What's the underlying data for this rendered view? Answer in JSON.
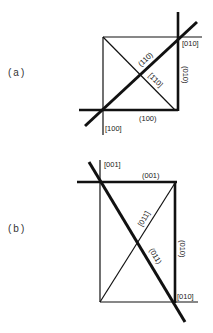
{
  "figure": {
    "panels": [
      {
        "id": "a",
        "label": "(a)",
        "annotations": {
          "top_right_direction": "[010]",
          "right_plane": "(010)",
          "diagonal_plane": "(110)",
          "anti_diagonal_direction": "[1̄10]",
          "bottom_plane": "(100)",
          "bottom_left_direction": "[100]"
        }
      },
      {
        "id": "b",
        "label": "(b)",
        "annotations": {
          "top_left_direction": "[001]",
          "top_plane": "(001)",
          "anti_diagonal_direction": "[011̄]",
          "diagonal_plane": "(011)",
          "right_plane": "(010)",
          "bottom_right_direction": "[010]"
        }
      }
    ],
    "colors": {
      "line": "#111111",
      "background": "#ffffff"
    }
  }
}
